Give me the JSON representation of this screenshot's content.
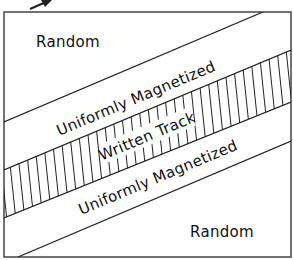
{
  "diagram": {
    "colors": {
      "line": "#222222",
      "background": "#ffffff",
      "text": "#111111"
    },
    "regions": [
      {
        "id": "random-top",
        "label": "Random"
      },
      {
        "id": "uniform-top",
        "label": "Uniformly Magnetized"
      },
      {
        "id": "written-track",
        "label": "Written Track",
        "fill": "vertical-hatch"
      },
      {
        "id": "uniform-bottom",
        "label": "Uniformly Magnetized"
      },
      {
        "id": "random-bottom",
        "label": "Random"
      }
    ],
    "pointer": {
      "icon": "arrow-icon",
      "direction": "up-right"
    }
  }
}
